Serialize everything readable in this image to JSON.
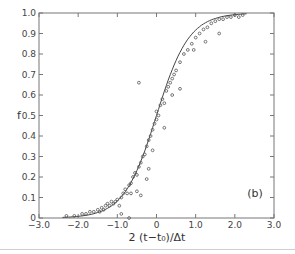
{
  "chart_data": {
    "type": "scatter",
    "title": "",
    "panel_label": "(b)",
    "xlabel": "2 (t−t₀)/Δt",
    "ylabel": "f",
    "xlim": [
      -3.0,
      3.0
    ],
    "ylim": [
      0,
      1.0
    ],
    "x_ticks": [
      -3.0,
      -2.0,
      -1.0,
      0,
      1.0,
      2.0,
      3.0
    ],
    "x_tick_labels": [
      "−3.0",
      "−2.0",
      "−1.0",
      "0",
      "1.0",
      "2.0",
      "3.0"
    ],
    "y_ticks": [
      0,
      0.1,
      0.2,
      0.3,
      0.4,
      0.5,
      0.6,
      0.7,
      0.8,
      0.9,
      1.0
    ],
    "y_tick_labels": [
      "0",
      "0.1",
      "0.2",
      "0.3",
      "0.4",
      "0.5",
      "0.6",
      "0.7",
      "0.8",
      "0.9",
      "1.0"
    ],
    "grid": false,
    "legend": null,
    "series": [
      {
        "name": "data points",
        "kind": "scatter",
        "marker": "open-circle",
        "points": [
          [
            -2.3,
            0.01
          ],
          [
            -2.1,
            0.01
          ],
          [
            -1.9,
            0.02
          ],
          [
            -1.8,
            0.02
          ],
          [
            -1.7,
            0.03
          ],
          [
            -1.6,
            0.03
          ],
          [
            -1.5,
            0.04
          ],
          [
            -1.45,
            0.03
          ],
          [
            -1.4,
            0.05
          ],
          [
            -1.35,
            0.04
          ],
          [
            -1.3,
            0.06
          ],
          [
            -1.25,
            0.07
          ],
          [
            -1.2,
            0.06
          ],
          [
            -1.15,
            0.08
          ],
          [
            -1.1,
            0.07
          ],
          [
            -1.05,
            0.08
          ],
          [
            -1.0,
            0.09
          ],
          [
            -0.95,
            0.06
          ],
          [
            -0.9,
            0.1
          ],
          [
            -0.85,
            0.12
          ],
          [
            -0.8,
            0.14
          ],
          [
            -0.75,
            0.12
          ],
          [
            -0.7,
            0.16
          ],
          [
            -0.65,
            0.12
          ],
          [
            -0.6,
            0.2
          ],
          [
            -0.55,
            0.22
          ],
          [
            -0.5,
            0.21
          ],
          [
            -0.45,
            0.25
          ],
          [
            -0.4,
            0.27
          ],
          [
            -0.35,
            0.3
          ],
          [
            -0.3,
            0.31
          ],
          [
            -0.25,
            0.35
          ],
          [
            -0.2,
            0.38
          ],
          [
            -0.15,
            0.4
          ],
          [
            -0.1,
            0.43
          ],
          [
            -0.05,
            0.46
          ],
          [
            0.0,
            0.48
          ],
          [
            0.0,
            0.52
          ],
          [
            0.05,
            0.5
          ],
          [
            0.1,
            0.55
          ],
          [
            0.15,
            0.58
          ],
          [
            0.2,
            0.56
          ],
          [
            0.25,
            0.62
          ],
          [
            0.3,
            0.64
          ],
          [
            0.35,
            0.66
          ],
          [
            0.4,
            0.68
          ],
          [
            0.45,
            0.7
          ],
          [
            0.5,
            0.72
          ],
          [
            0.6,
            0.76
          ],
          [
            0.7,
            0.8
          ],
          [
            0.8,
            0.82
          ],
          [
            0.9,
            0.85
          ],
          [
            1.0,
            0.88
          ],
          [
            1.1,
            0.9
          ],
          [
            1.2,
            0.92
          ],
          [
            1.3,
            0.93
          ],
          [
            1.4,
            0.95
          ],
          [
            1.5,
            0.96
          ],
          [
            1.6,
            0.97
          ],
          [
            1.7,
            0.97
          ],
          [
            1.8,
            0.98
          ],
          [
            1.9,
            0.98
          ],
          [
            2.0,
            0.99
          ],
          [
            2.1,
            0.98
          ],
          [
            2.2,
            0.99
          ],
          [
            -0.9,
            0.02
          ],
          [
            -0.7,
            0.0
          ],
          [
            -0.4,
            0.11
          ],
          [
            -0.25,
            0.19
          ],
          [
            -0.45,
            0.66
          ],
          [
            -0.65,
            0.17
          ],
          [
            -0.1,
            0.33
          ],
          [
            0.2,
            0.44
          ],
          [
            0.6,
            0.63
          ],
          [
            0.95,
            0.82
          ],
          [
            1.25,
            0.86
          ],
          [
            1.6,
            0.9
          ],
          [
            -0.5,
            0.13
          ],
          [
            -0.2,
            0.24
          ],
          [
            0.4,
            0.6
          ]
        ]
      },
      {
        "name": "fit",
        "kind": "line",
        "function": "sigmoid",
        "center": 0.0,
        "x_range": [
          -2.4,
          2.3
        ]
      }
    ]
  }
}
